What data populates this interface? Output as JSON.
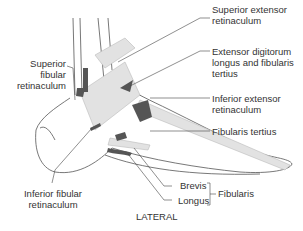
{
  "figure": {
    "view": "LATERAL",
    "labels": {
      "superior_extensor": [
        "Superior extensor",
        "retinaculum"
      ],
      "extensor_digitorum": [
        "Extensor digitorum",
        "longus and fibularis",
        "tertius"
      ],
      "inferior_extensor": [
        "Inferior extensor",
        "retinaculum"
      ],
      "fibularis_tertius": "Fibularis tertius",
      "superior_fibular": [
        "Superior",
        "fibular",
        "retinaculum"
      ],
      "inferior_fibular": [
        "Inferior fibular",
        "retinaculum"
      ],
      "brevis": "Brevis",
      "longus": "Longus",
      "fibularis": "Fibularis"
    },
    "colors": {
      "tendon_dark": "#555555",
      "outline": "#444444",
      "tendon_light": "#dcdcdc"
    }
  }
}
